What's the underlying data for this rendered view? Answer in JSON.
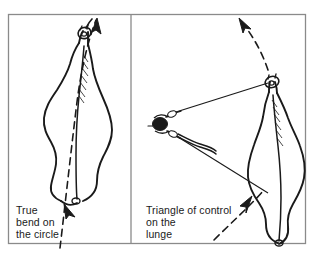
{
  "figure": {
    "type": "instructional-diagram",
    "background_color": "#ffffff",
    "ink_color": "#1a1a1a",
    "frame_color": "#888888"
  },
  "frame": {
    "outer": {
      "x": 8,
      "y": 14,
      "width": 298,
      "height": 230
    },
    "divider_x": 131
  },
  "panels": [
    {
      "id": "left",
      "name": "true-bend-panel",
      "caption_lines": [
        "True",
        "bend on",
        "the circle"
      ],
      "caption_text": "True\nbend on\nthe circle",
      "elements": [
        "horse-overhead-bent",
        "dashed-circle-track",
        "direction-arrow-top",
        "direction-arrow-bottom"
      ]
    },
    {
      "id": "right",
      "name": "triangle-of-control-panel",
      "caption_lines": [
        "Triangle of control",
        "on the",
        "lunge"
      ],
      "caption_text": "Triangle of control\non the\nlunge",
      "elements": [
        "horse-overhead-bent",
        "handler-overhead",
        "lunge-line",
        "lunge-whip",
        "dashed-circle-track",
        "direction-arrow-top",
        "direction-arrow-bottom"
      ]
    }
  ],
  "labels": {
    "left_caption": "True\nbend on\nthe circle",
    "right_caption": "Triangle of control\non the\nlunge"
  }
}
